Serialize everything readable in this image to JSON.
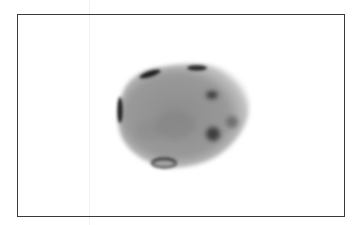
{
  "image": {
    "description": "Grayscale micrograph of an oval specimen with dark spots, enclosed in a thin black rectangular frame",
    "background_color": "#ffffff",
    "frame_color": "#3a3a3a",
    "specimen": {
      "body_color": "#8f8f8f",
      "spot_color": "#2a2a2a",
      "spots": [
        {
          "name": "left-edge-spot",
          "cx": 120,
          "cy": 110,
          "rx": 2.5,
          "ry": 13
        },
        {
          "name": "upper-left-spot",
          "cx": 150,
          "cy": 74,
          "rx": 11,
          "ry": 3
        },
        {
          "name": "top-spot",
          "cx": 197,
          "cy": 68,
          "rx": 10,
          "ry": 3
        },
        {
          "name": "right-upper-spot",
          "cx": 212,
          "cy": 95,
          "rx": 6,
          "ry": 4
        },
        {
          "name": "right-lower-spot",
          "cx": 213,
          "cy": 134,
          "rx": 7,
          "ry": 7
        },
        {
          "name": "right-faint-spot",
          "cx": 232,
          "cy": 122,
          "rx": 6,
          "ry": 6
        },
        {
          "name": "bottom-ring-spot",
          "cx": 164,
          "cy": 163,
          "rx": 12,
          "ry": 4.5
        }
      ]
    }
  }
}
